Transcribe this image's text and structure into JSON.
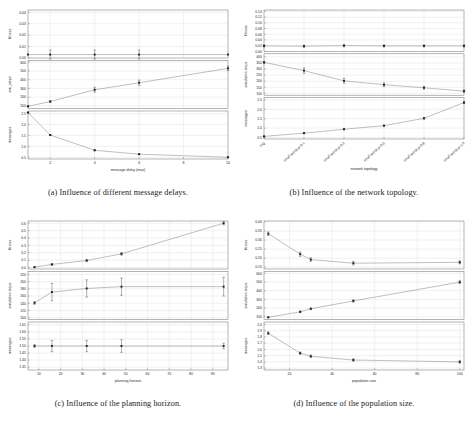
{
  "figure": {
    "kind": "multi-panel-figure",
    "panel_count": 4
  },
  "panels": [
    {
      "id": "a",
      "caption": "(a) Influence of different message delays.",
      "xlabel": "message delay (max)",
      "xlim": [
        1,
        10
      ],
      "xticks": [
        2,
        4,
        6,
        8,
        10
      ],
      "xticklabels": [
        "2",
        "4",
        "6",
        "8",
        "10"
      ],
      "subplots": [
        {
          "ylabel": "fitness",
          "ylim": [
            0.0,
            0.042
          ],
          "yticks": [
            0.0,
            0.01,
            0.02,
            0.03,
            0.04
          ],
          "yticklabels": [
            "0.00",
            "0.01",
            "0.02",
            "0.03",
            "0.04"
          ],
          "x": [
            1,
            2,
            4,
            6,
            10
          ],
          "y": [
            0.003,
            0.003,
            0.003,
            0.003,
            0.003
          ],
          "yerr": [
            0.0,
            0.004,
            0.004,
            0.004,
            0.0
          ]
        },
        {
          "ylabel": "sim_steps",
          "ylim": [
            70,
            620
          ],
          "yticks": [
            100,
            200,
            300,
            400,
            500,
            600
          ],
          "yticklabels": [
            "100",
            "200",
            "300",
            "400",
            "500",
            "600"
          ],
          "x": [
            1,
            2,
            4,
            6,
            10
          ],
          "y": [
            95,
            150,
            285,
            365,
            530
          ],
          "yerr": [
            5,
            12,
            28,
            30,
            25
          ]
        },
        {
          "ylabel": "messages",
          "ylim": [
            0.42,
            2.62
          ],
          "yticks": [
            0.5,
            1.0,
            1.5,
            2.0,
            2.5
          ],
          "yticklabels": [
            "0.5",
            "1.0",
            "1.5",
            "2.0",
            "2.5"
          ],
          "x": [
            1,
            2,
            4,
            6,
            10
          ],
          "y": [
            2.55,
            1.52,
            0.82,
            0.64,
            0.5
          ],
          "yerr": [
            0.02,
            0.02,
            0.02,
            0.02,
            0.02
          ]
        }
      ]
    },
    {
      "id": "b",
      "caption": "(b) Influence of the network topology.",
      "xlabel": "network topology",
      "xlim": [
        0,
        5
      ],
      "xticks": [
        0,
        1,
        2,
        3,
        4,
        5
      ],
      "xticklabels": [
        "ring",
        "small world p=0.1",
        "small world p=0.2",
        "small world p=0.5",
        "small world p=0.8",
        "small world p=1.0"
      ],
      "rotated_xticklabels": true,
      "subplots": [
        {
          "ylabel": "fitness",
          "ylim": [
            0.0,
            0.145
          ],
          "yticks": [
            0.0,
            0.02,
            0.04,
            0.06,
            0.08,
            0.1,
            0.12,
            0.14
          ],
          "yticklabels": [
            "0.00",
            "0.02",
            "0.04",
            "0.06",
            "0.08",
            "0.10",
            "0.12",
            "0.14"
          ],
          "x": [
            0,
            1,
            2,
            3,
            4,
            5
          ],
          "y": [
            0.019,
            0.018,
            0.02,
            0.019,
            0.019,
            0.019
          ],
          "yerr": [
            0.004,
            0.004,
            0.004,
            0.004,
            0.004,
            0.004
          ]
        },
        {
          "ylabel": "simulation steps",
          "ylim": [
            85,
            425
          ],
          "yticks": [
            100,
            150,
            200,
            250,
            300,
            350,
            400
          ],
          "yticklabels": [
            "100",
            "150",
            "200",
            "250",
            "300",
            "350",
            "400"
          ],
          "x": [
            0,
            1,
            2,
            3,
            4,
            5
          ],
          "y": [
            355,
            287,
            203,
            171,
            146,
            118
          ],
          "yerr": [
            8,
            22,
            20,
            15,
            12,
            10
          ]
        },
        {
          "ylabel": "messages",
          "ylim": [
            0.42,
            2.62
          ],
          "yticks": [
            0.5,
            1.0,
            1.5,
            2.0,
            2.5
          ],
          "yticklabels": [
            "0.5",
            "1.0",
            "1.5",
            "2.0",
            "2.5"
          ],
          "x": [
            0,
            1,
            2,
            3,
            4,
            5
          ],
          "y": [
            0.56,
            0.73,
            0.94,
            1.13,
            1.52,
            2.36
          ],
          "yerr": [
            0.02,
            0.03,
            0.03,
            0.03,
            0.04,
            0.05
          ]
        }
      ]
    },
    {
      "id": "c",
      "caption": "(c) Influence of the planning horizon.",
      "xlabel": "planning horizon",
      "xlim": [
        5,
        97
      ],
      "xticks": [
        10,
        20,
        30,
        40,
        50,
        60,
        70,
        80,
        90
      ],
      "xticklabels": [
        "10",
        "20",
        "30",
        "40",
        "50",
        "60",
        "70",
        "80",
        "90"
      ],
      "subplots": [
        {
          "ylabel": "fitness",
          "ylim": [
            -0.02,
            0.63
          ],
          "yticks": [
            0.0,
            0.1,
            0.2,
            0.3,
            0.4,
            0.5,
            0.6
          ],
          "yticklabels": [
            "0.0",
            "0.1",
            "0.2",
            "0.3",
            "0.4",
            "0.5",
            "0.6"
          ],
          "x": [
            8,
            16,
            32,
            48,
            95
          ],
          "y": [
            0.005,
            0.042,
            0.095,
            0.185,
            0.6
          ],
          "yerr": [
            0.004,
            0.012,
            0.014,
            0.018,
            0.022
          ]
        },
        {
          "ylabel": "simulation steps",
          "ylim": [
            95,
            228
          ],
          "yticks": [
            100,
            120,
            140,
            160,
            180,
            200,
            220
          ],
          "yticklabels": [
            "100",
            "120",
            "140",
            "160",
            "180",
            "200",
            "220"
          ],
          "x": [
            8,
            16,
            32,
            48,
            95
          ],
          "y": [
            141,
            171,
            181,
            186,
            186
          ],
          "yerr": [
            4,
            24,
            24,
            24,
            26
          ]
        },
        {
          "ylabel": "messages",
          "ylim": [
            1.33,
            1.67
          ],
          "yticks": [
            1.35,
            1.4,
            1.45,
            1.5,
            1.55,
            1.6,
            1.65
          ],
          "yticklabels": [
            "1.35",
            "1.40",
            "1.45",
            "1.50",
            "1.55",
            "1.60",
            "1.65"
          ],
          "x": [
            8,
            16,
            32,
            48,
            95
          ],
          "y": [
            1.5,
            1.5,
            1.5,
            1.5,
            1.5
          ],
          "yerr": [
            0.01,
            0.04,
            0.04,
            0.045,
            0.02
          ]
        }
      ]
    },
    {
      "id": "d",
      "caption": "(d) Influence of the population size.",
      "xlabel": "population size",
      "xlim": [
        8,
        102
      ],
      "xticks": [
        20,
        40,
        60,
        80,
        100
      ],
      "xticklabels": [
        "20",
        "40",
        "60",
        "80",
        "100"
      ],
      "subplots": [
        {
          "ylabel": "fitness",
          "ylim": [
            0.14,
            0.405
          ],
          "yticks": [
            0.15,
            0.2,
            0.25,
            0.3,
            0.35,
            0.4
          ],
          "yticklabels": [
            "0.15",
            "0.20",
            "0.25",
            "0.30",
            "0.35",
            "0.40"
          ],
          "x": [
            10,
            25,
            30,
            50,
            100
          ],
          "y": [
            0.335,
            0.222,
            0.192,
            0.172,
            0.177
          ],
          "yerr": [
            0.01,
            0.012,
            0.01,
            0.01,
            0.008
          ]
        },
        {
          "ylabel": "simulation steps",
          "ylim": [
            70,
            620
          ],
          "yticks": [
            100,
            200,
            300,
            400,
            500,
            600
          ],
          "yticklabels": [
            "100",
            "200",
            "300",
            "400",
            "500",
            "600"
          ],
          "x": [
            10,
            25,
            30,
            50,
            100
          ],
          "y": [
            95,
            158,
            193,
            283,
            498
          ],
          "yerr": [
            4,
            10,
            10,
            14,
            16
          ]
        },
        {
          "ylabel": "messages",
          "ylim": [
            1.27,
            2.04
          ],
          "yticks": [
            1.3,
            1.4,
            1.5,
            1.6,
            1.7,
            1.8,
            1.9,
            2.0
          ],
          "yticklabels": [
            "1.3",
            "1.4",
            "1.5",
            "1.6",
            "1.7",
            "1.8",
            "1.9",
            "2.0"
          ],
          "x": [
            10,
            25,
            30,
            50,
            100
          ],
          "y": [
            1.86,
            1.54,
            1.49,
            1.43,
            1.4
          ],
          "yerr": [
            0.02,
            0.02,
            0.02,
            0.02,
            0.02
          ]
        }
      ]
    }
  ],
  "colors": {
    "line": "#707070",
    "marker": "#1e1e1e",
    "grid": "#cfcfcf",
    "frame": "#5a5a5a",
    "text": "#2b2b2b"
  }
}
